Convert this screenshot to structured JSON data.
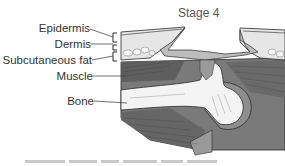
{
  "figure": {
    "title": "Stage 4",
    "labels": {
      "epidermis": "Epidermis",
      "dermis": "Dermis",
      "subcutaneous_fat": "Subcutaneous fat",
      "muscle": "Muscle",
      "bone": "Bone"
    },
    "colors": {
      "skin": "#e8e8e8",
      "wound_bed": "#bdbdbd",
      "muscle_dark": "#6e6e6e",
      "muscle_mid": "#8c8c8c",
      "bone": "#f4f4f4",
      "outline": "#2a2a2a",
      "label_text": "#333333"
    }
  }
}
